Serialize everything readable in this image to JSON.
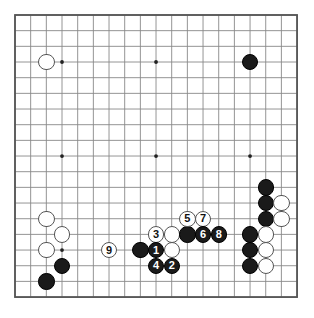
{
  "diagram": {
    "kind": "go-board-diagram",
    "board_size": 19,
    "geometry": {
      "origin_x": 15,
      "origin_y": 15,
      "spacing": 15.67,
      "stone_radius": 8.2,
      "border_color": "#555555",
      "grid_color": "#888888",
      "background": "#ffffff"
    },
    "star_points": [
      {
        "col": 3,
        "row": 3
      },
      {
        "col": 9,
        "row": 3
      },
      {
        "col": 15,
        "row": 3
      },
      {
        "col": 3,
        "row": 9
      },
      {
        "col": 9,
        "row": 9
      },
      {
        "col": 15,
        "row": 9
      },
      {
        "col": 3,
        "row": 15
      },
      {
        "col": 9,
        "row": 15
      },
      {
        "col": 15,
        "row": 15
      }
    ],
    "colors": {
      "black_stone": "#1a1a1a",
      "white_stone": "#ffffff",
      "white_stone_outline": "#555555",
      "black_label_text": "#ffffff",
      "white_label_text": "#111111"
    },
    "stones": [
      {
        "id": "w-c2r3",
        "color": "white",
        "col": 2,
        "row": 3,
        "label": ""
      },
      {
        "id": "b-c15r3",
        "color": "black",
        "col": 15,
        "row": 3,
        "label": ""
      },
      {
        "id": "b-c16r11",
        "color": "black",
        "col": 16,
        "row": 11,
        "label": ""
      },
      {
        "id": "b-c16r12",
        "color": "black",
        "col": 16,
        "row": 12,
        "label": ""
      },
      {
        "id": "w-c17r12",
        "color": "white",
        "col": 17,
        "row": 12,
        "label": ""
      },
      {
        "id": "b-c16r13",
        "color": "black",
        "col": 16,
        "row": 13,
        "label": ""
      },
      {
        "id": "w-c17r13",
        "color": "white",
        "col": 17,
        "row": 13,
        "label": ""
      },
      {
        "id": "w-c2r13",
        "color": "white",
        "col": 2,
        "row": 13,
        "label": ""
      },
      {
        "id": "w-c3r14",
        "color": "white",
        "col": 3,
        "row": 14,
        "label": ""
      },
      {
        "id": "w-c2r15",
        "color": "white",
        "col": 2,
        "row": 15,
        "label": ""
      },
      {
        "id": "b-c3r16",
        "color": "black",
        "col": 3,
        "row": 16,
        "label": ""
      },
      {
        "id": "b-c2r17",
        "color": "black",
        "col": 2,
        "row": 17,
        "label": ""
      },
      {
        "id": "b-c15r14",
        "color": "black",
        "col": 15,
        "row": 14,
        "label": ""
      },
      {
        "id": "w-c16r14",
        "color": "white",
        "col": 16,
        "row": 14,
        "label": ""
      },
      {
        "id": "b-c15r15",
        "color": "black",
        "col": 15,
        "row": 15,
        "label": ""
      },
      {
        "id": "w-c16r15",
        "color": "white",
        "col": 16,
        "row": 15,
        "label": ""
      },
      {
        "id": "b-c15r16",
        "color": "black",
        "col": 15,
        "row": 16,
        "label": ""
      },
      {
        "id": "w-c16r16",
        "color": "white",
        "col": 16,
        "row": 16,
        "label": ""
      },
      {
        "id": "b-c8r15",
        "color": "black",
        "col": 8,
        "row": 15,
        "label": ""
      },
      {
        "id": "w-c10r14",
        "color": "white",
        "col": 10,
        "row": 14,
        "label": ""
      },
      {
        "id": "w-c10r15",
        "color": "white",
        "col": 10,
        "row": 15,
        "label": ""
      },
      {
        "id": "b-c11r14",
        "color": "black",
        "col": 11,
        "row": 14,
        "label": ""
      },
      {
        "id": "m9",
        "color": "white",
        "col": 6,
        "row": 15,
        "label": "9"
      },
      {
        "id": "m3",
        "color": "white",
        "col": 9,
        "row": 14,
        "label": "3"
      },
      {
        "id": "m1",
        "color": "black",
        "col": 9,
        "row": 15,
        "label": "1"
      },
      {
        "id": "m4",
        "color": "black",
        "col": 9,
        "row": 16,
        "label": "4"
      },
      {
        "id": "m2",
        "color": "black",
        "col": 10,
        "row": 16,
        "label": "2"
      },
      {
        "id": "m5",
        "color": "white",
        "col": 11,
        "row": 13,
        "label": "5"
      },
      {
        "id": "m7",
        "color": "white",
        "col": 12,
        "row": 13,
        "label": "7"
      },
      {
        "id": "m6",
        "color": "black",
        "col": 12,
        "row": 14,
        "label": "6"
      },
      {
        "id": "m8",
        "color": "black",
        "col": 13,
        "row": 14,
        "label": "8"
      }
    ],
    "move_sequence": [
      {
        "number": "1",
        "color": "black"
      },
      {
        "number": "2",
        "color": "black"
      },
      {
        "number": "3",
        "color": "white"
      },
      {
        "number": "4",
        "color": "black"
      },
      {
        "number": "5",
        "color": "white"
      },
      {
        "number": "6",
        "color": "black"
      },
      {
        "number": "7",
        "color": "white"
      },
      {
        "number": "8",
        "color": "black"
      },
      {
        "number": "9",
        "color": "white"
      }
    ]
  }
}
